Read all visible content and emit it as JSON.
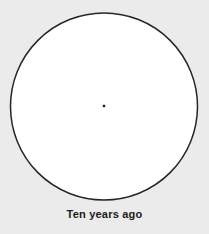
{
  "figure": {
    "caption": "Ten years ago",
    "background_color": "#ebebeb",
    "shape": {
      "name": "circle",
      "fill_color": "#ffffff",
      "stroke_color": "#262626",
      "stroke_width": 1.5,
      "center_x": 104,
      "center_y": 106.5,
      "radius": 93.5
    },
    "center_marker": {
      "name": "center-dot",
      "color": "#1a1a1a",
      "x": 104,
      "y": 106,
      "size": 2.4
    }
  },
  "chart_data": {
    "type": "pie",
    "title": "Ten years ago",
    "subtitle": "",
    "xlabel": "",
    "ylabel": "",
    "categories": [
      "Whole"
    ],
    "values": [
      100
    ],
    "labels": [
      "100%"
    ],
    "legend": [],
    "legend_position": "none",
    "grid": false,
    "annotations": [
      "Ten years ago"
    ],
    "note": "Single undivided circle with a marked center point; represents one unbroken whole (100%, no slices)."
  }
}
